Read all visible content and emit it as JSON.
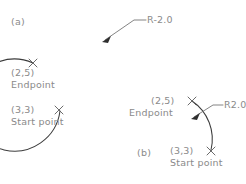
{
  "figure": {
    "type": "technical-drawing",
    "background_color": "#ffffff",
    "line_color": "#3c3c3c",
    "text_color": "#8a8a8a"
  },
  "diagrams": [
    {
      "id": "a",
      "caption": "(a)",
      "arc": {
        "kind": "major-arc",
        "radius_label": "R-2.0",
        "radius_value": 2.0,
        "start_point_label": "(3,3)",
        "start_point_caption": "Start point",
        "end_point_label": "(2,5)",
        "end_point_caption": "Endpoint"
      }
    },
    {
      "id": "b",
      "caption": "(b)",
      "arc": {
        "kind": "minor-arc",
        "radius_label": "R2.0",
        "radius_value": 2.0,
        "start_point_label": "(3,3)",
        "start_point_caption": "Start point",
        "end_point_label": "(2,5)",
        "end_point_caption": "Endpoint"
      }
    }
  ]
}
